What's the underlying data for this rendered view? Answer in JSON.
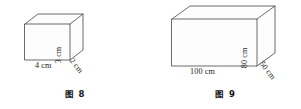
{
  "document": {
    "kind": "geometry-figure-pair",
    "background_color": "#ffffff",
    "line_color": "#454545",
    "text_color": "#1b1b1b"
  },
  "figures": [
    {
      "id": "figure-8",
      "caption": "图 8",
      "shape": "cuboid",
      "labels": {
        "width": "4 cm",
        "height": "3 cm",
        "depth": "2 cm"
      }
    },
    {
      "id": "figure-9",
      "caption": "图 9",
      "shape": "cuboid",
      "labels": {
        "width": "100 cm",
        "height": "80 cm",
        "depth": "50 cm"
      }
    }
  ]
}
